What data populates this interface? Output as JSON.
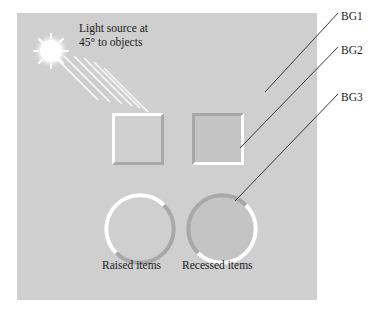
{
  "figure": {
    "background_color": "#ffffff",
    "panel": {
      "name": "surface-panel",
      "color": "#cfcfcf",
      "x": 17,
      "y": 13,
      "width": 300,
      "height": 287
    },
    "light": {
      "icon": "sun-icon",
      "caption": "Light source at\n45° to objects",
      "angle_degrees": 45,
      "ray_count": 6,
      "highlight_color": "#ffffff"
    },
    "objects": [
      {
        "id": "raised-square",
        "shape": "square",
        "style": "raised",
        "fill": "#cfcfcf",
        "highlight": "#ffffff",
        "shadow": "#a8a8a8"
      },
      {
        "id": "recessed-square",
        "shape": "square",
        "style": "recessed",
        "fill": "#c4c4c4",
        "highlight": "#ffffff",
        "shadow": "#a8a8a8"
      },
      {
        "id": "raised-circle",
        "shape": "circle",
        "style": "raised",
        "fill": "#cfcfcf",
        "highlight": "#ffffff",
        "shadow": "#a8a8a8"
      },
      {
        "id": "recessed-circle",
        "shape": "circle",
        "style": "recessed",
        "fill": "#c4c4c4",
        "highlight": "#ffffff",
        "shadow": "#a8a8a8"
      }
    ],
    "item_labels": {
      "raised": "Raised items",
      "recessed": "Recessed items"
    },
    "callouts": [
      {
        "id": "bg1",
        "label": "BG1",
        "target": "background surface"
      },
      {
        "id": "bg2",
        "label": "BG2",
        "target": "recessed square interior"
      },
      {
        "id": "bg3",
        "label": "BG3",
        "target": "recessed circle edge"
      }
    ],
    "line_color": "#3a3a3a",
    "text_color": "#1a1a1a"
  }
}
